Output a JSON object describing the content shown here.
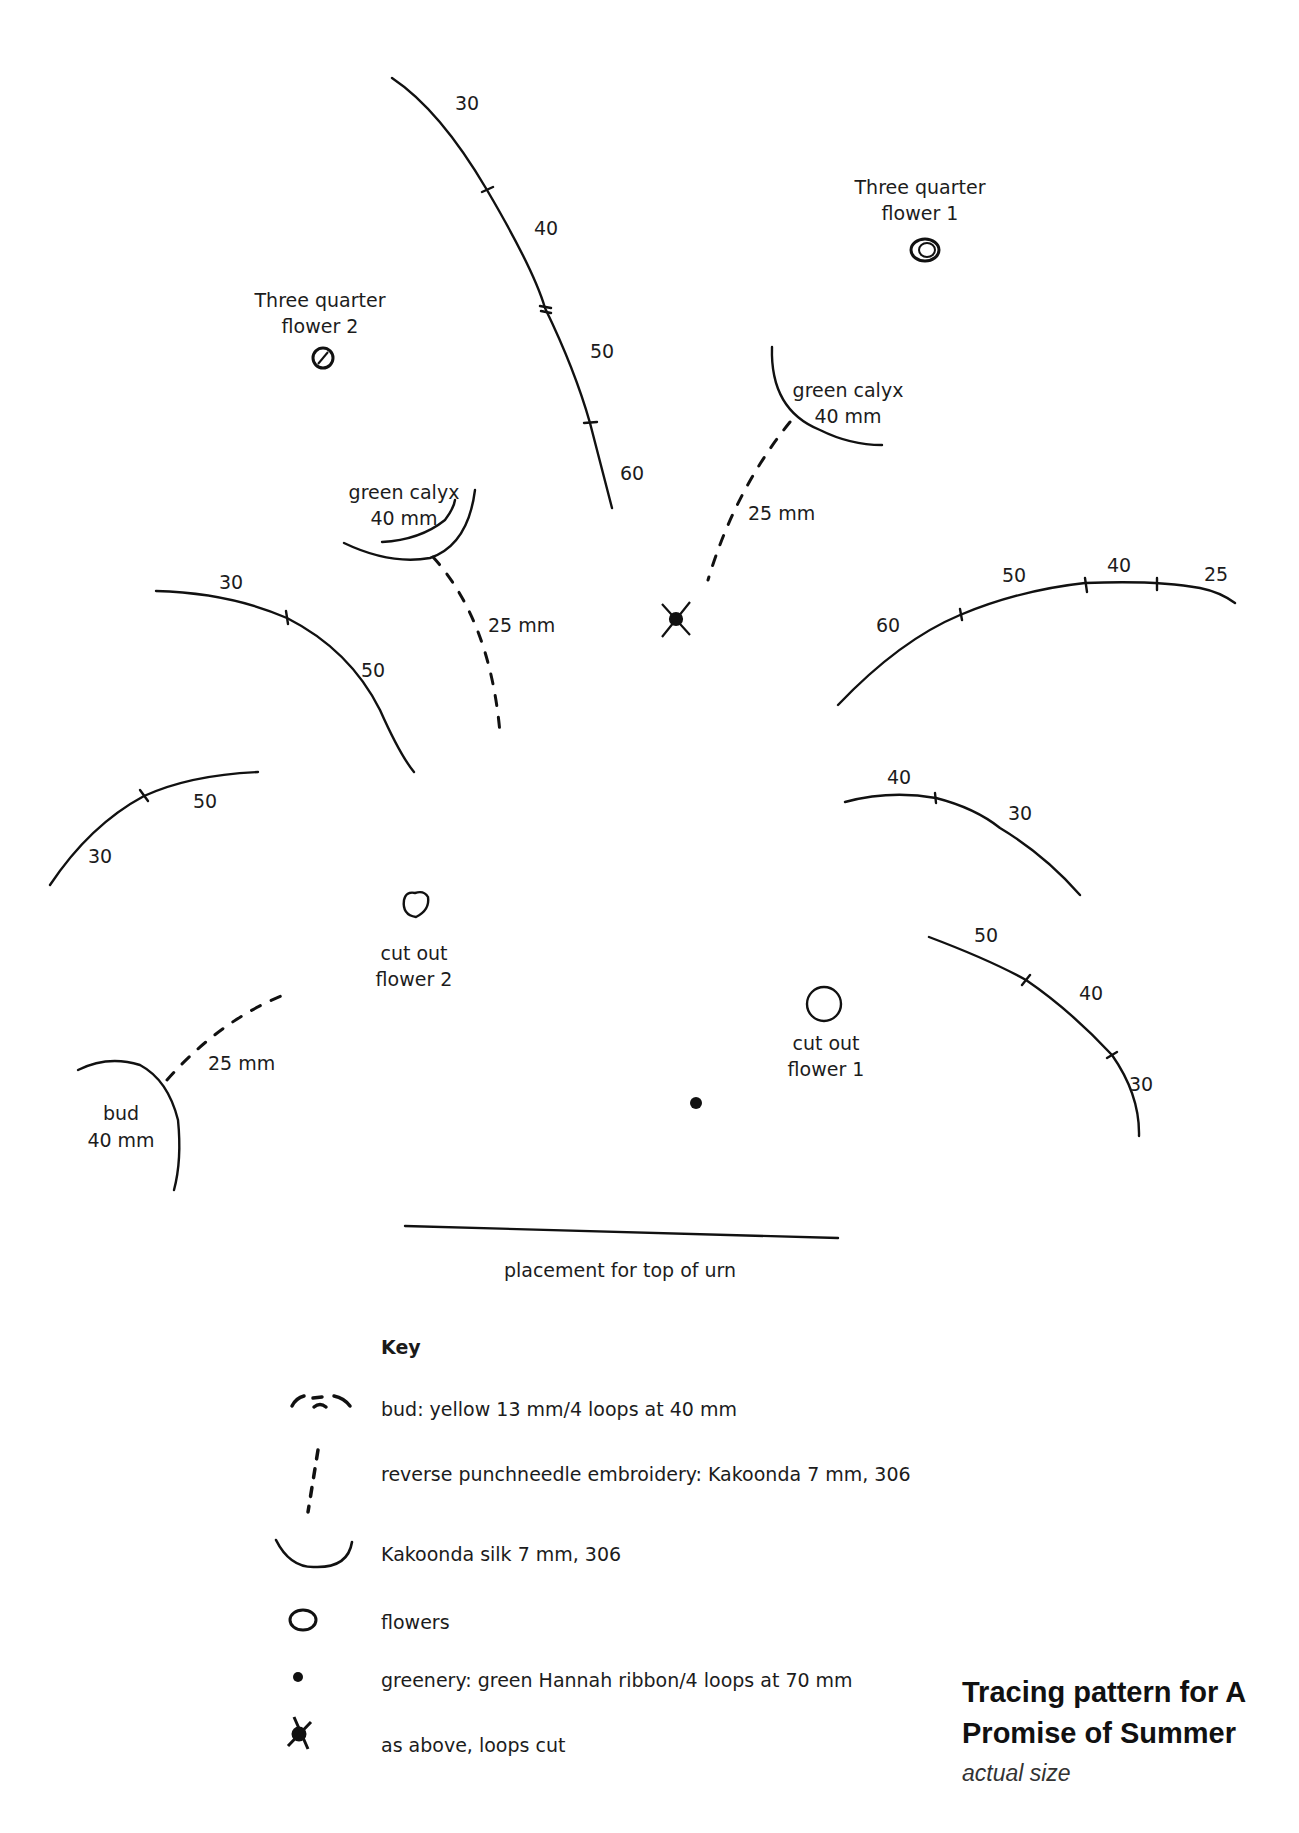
{
  "title": {
    "line1": "Tracing pattern for A",
    "line2": "Promise of Summer",
    "subtitle": "actual size"
  },
  "labels": {
    "three_quarter_flower_1": [
      "Three quarter",
      "flower 1"
    ],
    "three_quarter_flower_2": [
      "Three quarter",
      "flower 2"
    ],
    "green_calyx_right": [
      "green calyx",
      "40 mm"
    ],
    "green_calyx_left": [
      "green calyx",
      "40 mm"
    ],
    "cut_out_flower_1": [
      "cut out",
      "flower 1"
    ],
    "cut_out_flower_2": [
      "cut out",
      "flower 2"
    ],
    "bud": [
      "bud",
      "40 mm"
    ],
    "stem_right": "25 mm",
    "stem_left": "25 mm",
    "stem_bud": "25 mm",
    "urn": "placement for top of urn"
  },
  "arcs": {
    "top": [
      "30",
      "40",
      "50",
      "60"
    ],
    "right_upper": [
      "60",
      "50",
      "40",
      "25"
    ],
    "left_upper": [
      "30",
      "50"
    ],
    "left_lower": [
      "50",
      "30"
    ],
    "right_mid": [
      "40",
      "30"
    ],
    "right_lower": [
      "50",
      "40",
      "30"
    ]
  },
  "key": {
    "title": "Key",
    "items": [
      {
        "icon": "bud-icon",
        "text": "bud: yellow 13 mm/4 loops at 40 mm"
      },
      {
        "icon": "dashed-line-icon",
        "text": "reverse punchneedle embroidery: Kakoonda 7 mm, 306"
      },
      {
        "icon": "arc-icon",
        "text": "Kakoonda silk 7 mm, 306"
      },
      {
        "icon": "flower-circle-icon",
        "text": "flowers"
      },
      {
        "icon": "dot-icon",
        "text": "greenery: green Hannah ribbon/4 loops at 70 mm"
      },
      {
        "icon": "cross-dot-icon",
        "text": "as above, loops cut"
      }
    ]
  }
}
